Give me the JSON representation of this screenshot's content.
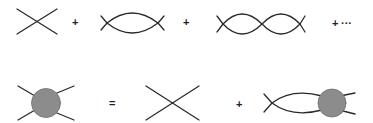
{
  "diagram": {
    "colors": {
      "line": "#2a2a2a",
      "blob_fill": "#8c8c8c",
      "blob_stroke": "#6e6e6e",
      "background": "#ffffff"
    },
    "top_row": {
      "terms": [
        {
          "type": "tree-vertex",
          "label": "bare four-point vertex"
        },
        {
          "type": "one-loop-bubble",
          "label": "one-loop bubble"
        },
        {
          "type": "two-loop-bubble-chain",
          "label": "two-loop bubble chain"
        }
      ],
      "operators": [
        "+",
        "+",
        "+"
      ],
      "ellipsis": "···"
    },
    "bottom_row": {
      "lhs": {
        "type": "full-vertex-blob",
        "label": "full (resummed) vertex"
      },
      "equals": "=",
      "rhs_terms": [
        {
          "type": "tree-vertex",
          "label": "bare four-point vertex"
        },
        {
          "type": "bubble-with-full-vertex",
          "label": "bare vertex + loop + full vertex"
        }
      ],
      "operators": [
        "+"
      ]
    }
  }
}
